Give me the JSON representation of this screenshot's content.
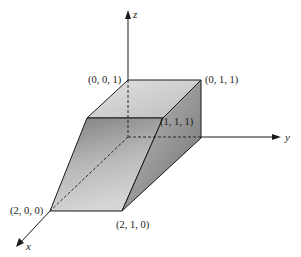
{
  "figure": {
    "type": "3d-solid-diagram",
    "axes": {
      "x_label": "x",
      "y_label": "y",
      "z_label": "z"
    },
    "vertices": [
      {
        "label": "(0, 0, 1)"
      },
      {
        "label": "(0, 1, 1)"
      },
      {
        "label": "(1, 1, 1)"
      },
      {
        "label": "(2, 0, 0)"
      },
      {
        "label": "(2, 1, 0)"
      }
    ],
    "colors": {
      "line": "#1a1a1a",
      "top_face": "#d0d0d0",
      "front_face": "#a8a8a8",
      "side_face": "#8f8f8f"
    }
  }
}
